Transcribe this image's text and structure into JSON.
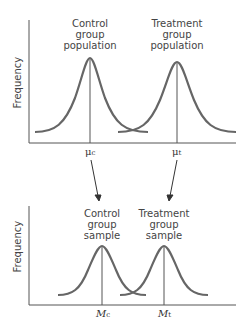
{
  "diagram": {
    "top_panel": {
      "ylabel": "Frequency",
      "curves": [
        {
          "label_line1": "Control",
          "label_line2": "group",
          "label_line3": "population",
          "mean_symbol": "μ",
          "mean_sub": "c"
        },
        {
          "label_line1": "Treatment",
          "label_line2": "group",
          "label_line3": "population",
          "mean_symbol": "μ",
          "mean_sub": "t"
        }
      ]
    },
    "bottom_panel": {
      "ylabel": "Frequency",
      "curves": [
        {
          "label_line1": "Control",
          "label_line2": "group",
          "label_line3": "sample",
          "mean_symbol": "M",
          "mean_sub": "c"
        },
        {
          "label_line1": "Treatment",
          "label_line2": "group",
          "label_line3": "sample",
          "mean_symbol": "M",
          "mean_sub": "t"
        }
      ]
    },
    "colors": {
      "curve": "#666666",
      "axis": "#555555",
      "text": "#444444"
    }
  }
}
